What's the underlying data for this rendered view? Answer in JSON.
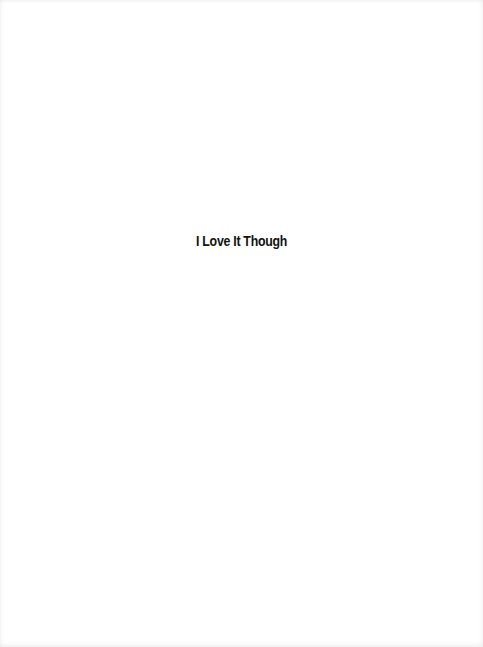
{
  "page": {
    "title": "I Love It Though"
  }
}
